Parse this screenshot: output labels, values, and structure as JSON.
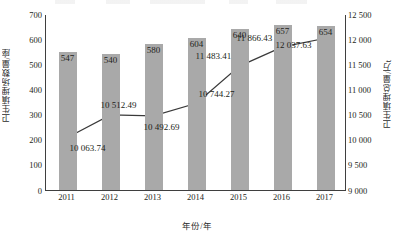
{
  "chart_data": {
    "type": "bar",
    "title": "",
    "xlabel": "年份/年",
    "ylabel": "卫生填埋场数量/座",
    "ylabel_secondary": "卫生填埋总量/万t",
    "categories": [
      "2011",
      "2012",
      "2013",
      "2014",
      "2015",
      "2016",
      "2017"
    ],
    "grid": false,
    "legend": "none",
    "ylim": [
      0,
      700
    ],
    "ylim_secondary": [
      9000,
      12500
    ],
    "yticks": [
      "700",
      "600",
      "500",
      "400",
      "300",
      "200",
      "100",
      "0"
    ],
    "ytick_values": [
      700,
      600,
      500,
      400,
      300,
      200,
      100,
      0
    ],
    "yticks_secondary": [
      "12 500",
      "12 000",
      "11 500",
      "11 000",
      "10 500",
      "10 000",
      "9 500",
      "9 000"
    ],
    "ytick_values_secondary": [
      12500,
      12000,
      11500,
      11000,
      10500,
      10000,
      9500,
      9000
    ],
    "series": [
      {
        "name": "卫生填埋场数量/座",
        "type": "bar",
        "axis": "left",
        "color": "#a9a9a9",
        "values": [
          547,
          540,
          580,
          604,
          640,
          657,
          654
        ],
        "labels": [
          "547",
          "540",
          "580",
          "604",
          "640",
          "657",
          "654"
        ]
      },
      {
        "name": "卫生填埋总量/万t",
        "type": "line",
        "axis": "right",
        "color": "#3a3a3a",
        "values": [
          10063.74,
          10512.49,
          10492.69,
          10744.27,
          11483.41,
          11866.43,
          12037.63
        ],
        "labels": [
          "10 063.74",
          "10 512.49",
          "10 492.69",
          "10 744.27",
          "11 483.41",
          "11 866.43",
          "12 037.63"
        ]
      }
    ]
  }
}
